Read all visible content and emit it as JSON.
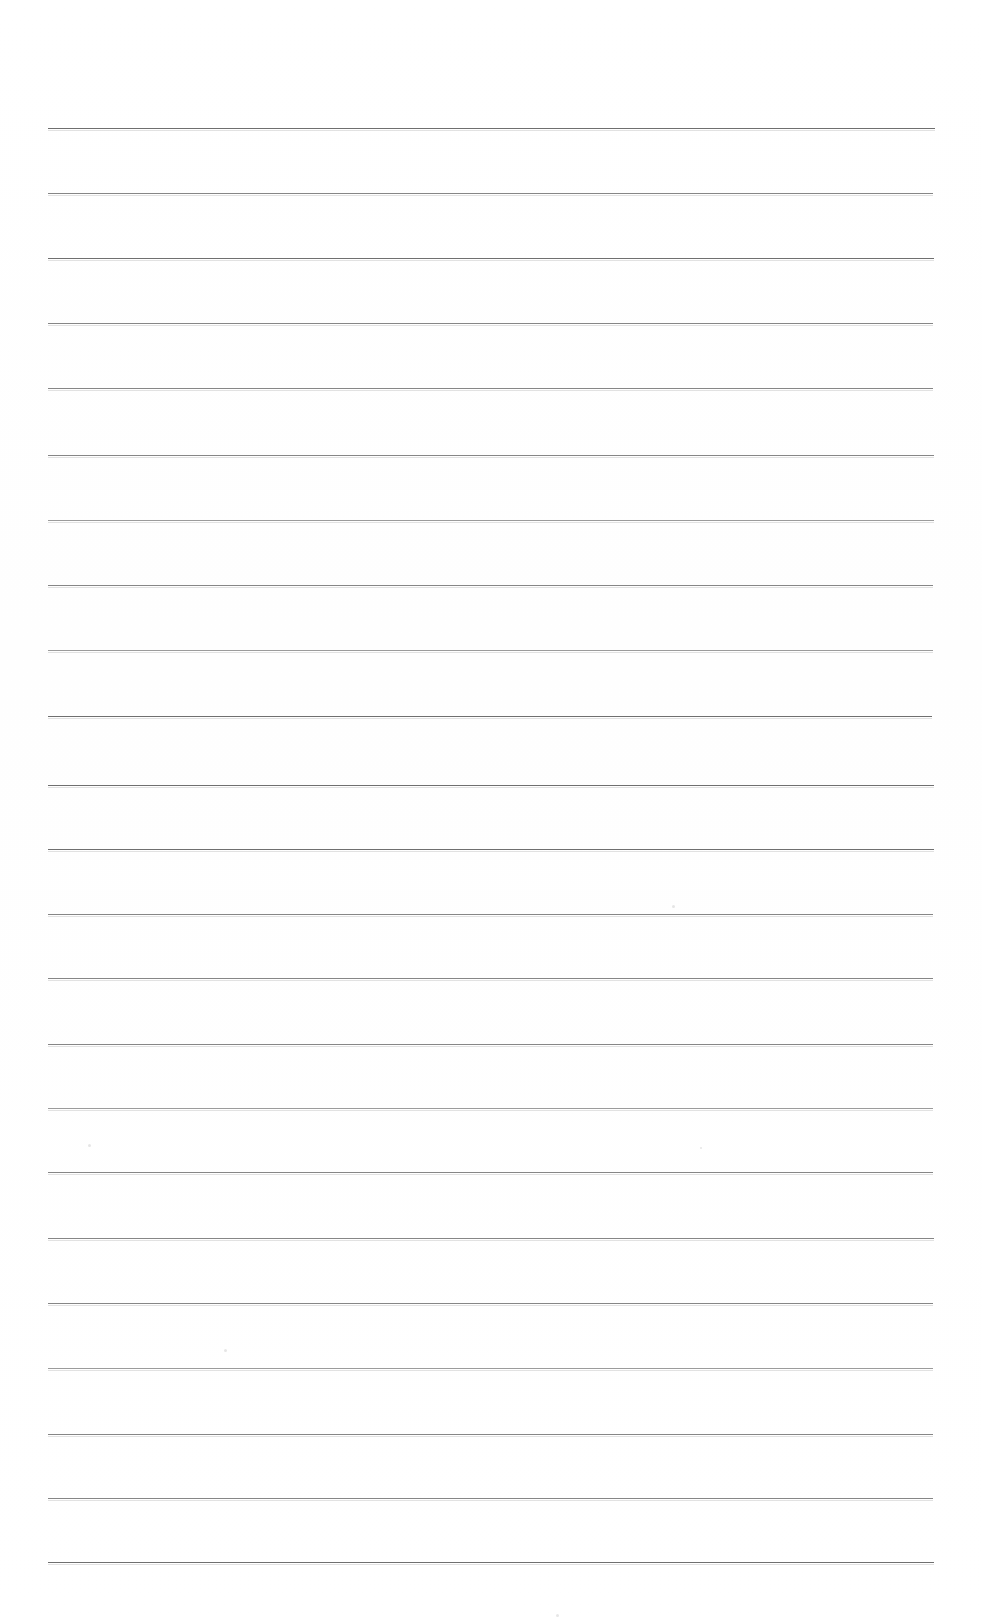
{
  "document": {
    "kind": "scanned-lined-paper",
    "title": "Blank Ruled Notebook Page",
    "page_width": 982,
    "page_height": 1623,
    "background_color": "#ffffff",
    "rule_color": "#8a8a8a",
    "content_text": "",
    "is_blank": true,
    "visible_text_blocks": []
  },
  "ruling": {
    "line_count": 22,
    "left_margin_x": 48,
    "right_margin_x": 935,
    "line_length": 887,
    "first_line_y": 128,
    "average_spacing": 65,
    "lines": [
      {
        "y": 128,
        "x1": 48,
        "x2": 935,
        "weight": "strong"
      },
      {
        "y": 193,
        "x1": 48,
        "x2": 933,
        "weight": "medium"
      },
      {
        "y": 258,
        "x1": 48,
        "x2": 934,
        "weight": "strong"
      },
      {
        "y": 323,
        "x1": 48,
        "x2": 933,
        "weight": "medium"
      },
      {
        "y": 388,
        "x1": 48,
        "x2": 933,
        "weight": "medium"
      },
      {
        "y": 455,
        "x1": 48,
        "x2": 934,
        "weight": "medium"
      },
      {
        "y": 520,
        "x1": 48,
        "x2": 934,
        "weight": "light"
      },
      {
        "y": 585,
        "x1": 48,
        "x2": 933,
        "weight": "medium"
      },
      {
        "y": 650,
        "x1": 48,
        "x2": 933,
        "weight": "light"
      },
      {
        "y": 716,
        "x1": 48,
        "x2": 932,
        "weight": "strong"
      },
      {
        "y": 785,
        "x1": 48,
        "x2": 934,
        "weight": "strong"
      },
      {
        "y": 849,
        "x1": 48,
        "x2": 934,
        "weight": "strong"
      },
      {
        "y": 914,
        "x1": 48,
        "x2": 933,
        "weight": "medium"
      },
      {
        "y": 978,
        "x1": 48,
        "x2": 933,
        "weight": "medium"
      },
      {
        "y": 1044,
        "x1": 48,
        "x2": 933,
        "weight": "medium"
      },
      {
        "y": 1108,
        "x1": 48,
        "x2": 933,
        "weight": "light"
      },
      {
        "y": 1172,
        "x1": 48,
        "x2": 933,
        "weight": "medium"
      },
      {
        "y": 1238,
        "x1": 48,
        "x2": 934,
        "weight": "medium"
      },
      {
        "y": 1303,
        "x1": 48,
        "x2": 933,
        "weight": "medium"
      },
      {
        "y": 1368,
        "x1": 48,
        "x2": 933,
        "weight": "light"
      },
      {
        "y": 1434,
        "x1": 48,
        "x2": 933,
        "weight": "medium"
      },
      {
        "y": 1498,
        "x1": 48,
        "x2": 933,
        "weight": "medium"
      },
      {
        "y": 1562,
        "x1": 48,
        "x2": 934,
        "weight": "strong"
      }
    ]
  },
  "artifacts": {
    "specks": [
      {
        "x": 672,
        "y": 905,
        "size": 3
      },
      {
        "x": 88,
        "y": 1144,
        "size": 3
      },
      {
        "x": 700,
        "y": 1147,
        "size": 2
      },
      {
        "x": 224,
        "y": 1349,
        "size": 3
      },
      {
        "x": 556,
        "y": 1614,
        "size": 3
      }
    ]
  }
}
